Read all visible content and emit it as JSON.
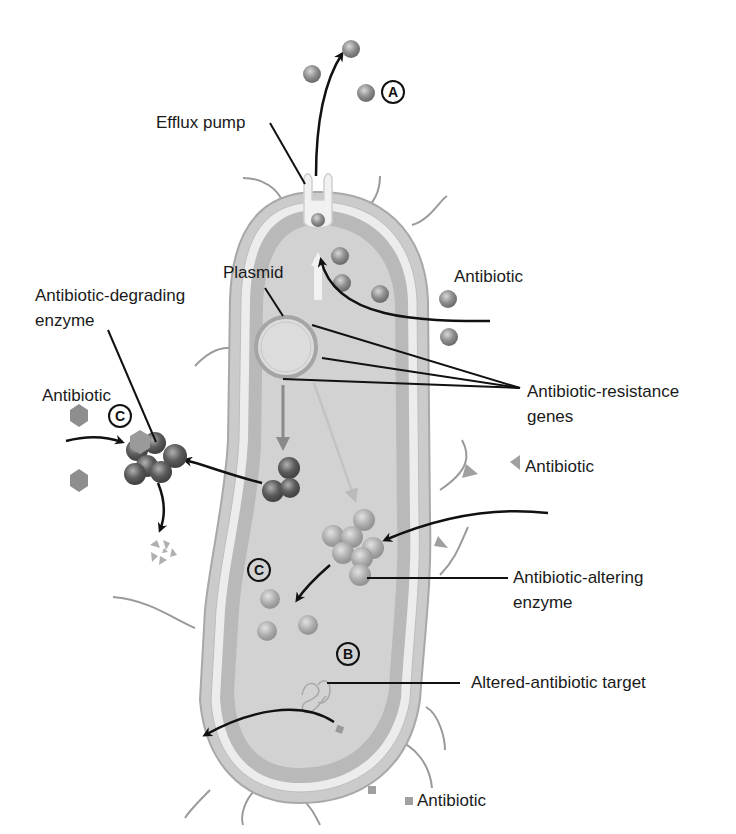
{
  "figure": {
    "labels": {
      "efflux_pump": "Efflux pump",
      "plasmid": "Plasmid",
      "antibiotic_top_right": "Antibiotic",
      "degrading_enzyme_line1": "Antibiotic-degrading",
      "degrading_enzyme_line2": "enzyme",
      "antibiotic_left": "Antibiotic",
      "resistance_genes_line1": "Antibiotic-resistance",
      "resistance_genes_line2": "genes",
      "antibiotic_triangle": "Antibiotic",
      "altering_enzyme_line1": "Antibiotic-altering",
      "altering_enzyme_line2": "enzyme",
      "altered_target": "Altered-antibiotic target",
      "antibiotic_square": "Antibiotic"
    },
    "mechanism_markers": {
      "a": "A",
      "b": "B",
      "c_left": "C",
      "c_inner": "C"
    },
    "colors": {
      "cell_outer": "#c9c9c9",
      "cell_membrane": "#e6e6e6",
      "cytoplasm": "#b5b5b5",
      "cytoplasm_inner": "#cfcfcf",
      "molecule": "#8c8c8c",
      "enzyme_dark": "#6a6a6a",
      "arrow": "#111111",
      "text": "#1a1a1a"
    }
  }
}
